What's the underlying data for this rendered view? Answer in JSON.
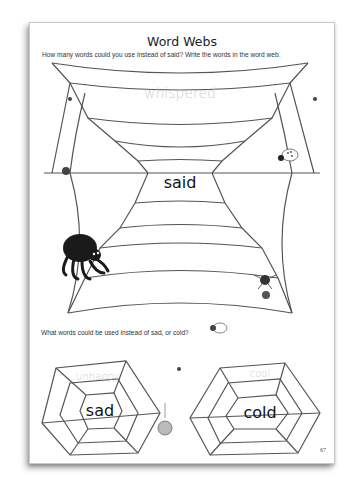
{
  "worksheet": {
    "title": "Word Webs",
    "instruction_main": "How many words could you use instead of said? Write the words in the word web.",
    "instruction_secondary": "What words could be used instead of sad, or cold?",
    "page_number": "67"
  },
  "webs": [
    {
      "center_word": "said",
      "example_word": "whispered"
    },
    {
      "center_word": "sad",
      "example_word": "unhappy"
    },
    {
      "center_word": "cold",
      "example_word": "cool"
    }
  ],
  "illustrations": [
    "large-black-spider",
    "spotted-spider",
    "small-spider-with-ball",
    "small-flies",
    "hanging-spider",
    "white-spider"
  ]
}
